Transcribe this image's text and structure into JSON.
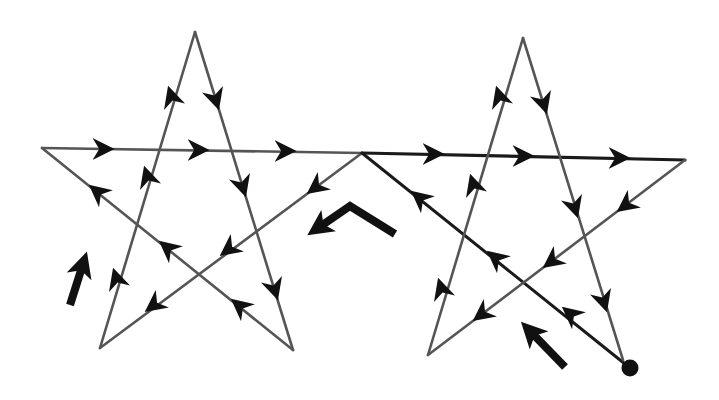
{
  "title": "Two pentagram stars traced in one continuous path",
  "colors": {
    "background": "#ffffff",
    "line": "#555555",
    "path_start_line": "#1a1a1a",
    "arrowhead": "#111111",
    "hint_arrow": "#111111",
    "start_dot": "#111111"
  },
  "stars": [
    {
      "name": "left-star",
      "vertices": {
        "top": [
          195,
          32
        ],
        "left": [
          42,
          148
        ],
        "right": [
          362,
          153
        ],
        "bottom_left": [
          100,
          348
        ],
        "bottom_right": [
          293,
          350
        ]
      }
    },
    {
      "name": "right-star",
      "vertices": {
        "top": [
          523,
          38
        ],
        "left": [
          362,
          153
        ],
        "right": [
          685,
          160
        ],
        "bottom_left": [
          428,
          355
        ],
        "bottom_right": [
          623,
          360
        ]
      }
    }
  ],
  "start_point": [
    630,
    368
  ],
  "hint_arrows": [
    {
      "name": "hint-arrow-bottom-right",
      "from": [
        565,
        367
      ],
      "to": [
        522,
        322
      ]
    },
    {
      "name": "hint-arrow-center-chevron",
      "path": [
        [
          395,
          234
        ],
        [
          350,
          204
        ],
        [
          310,
          234
        ]
      ]
    },
    {
      "name": "hint-arrow-left",
      "from": [
        68,
        306
      ],
      "to": [
        86,
        252
      ]
    }
  ]
}
